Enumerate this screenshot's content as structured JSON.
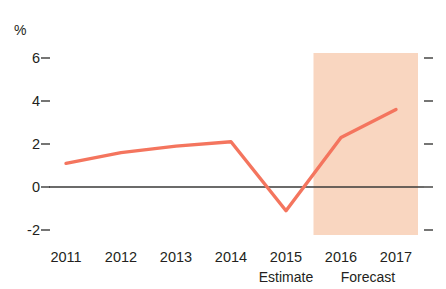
{
  "chart_data": {
    "type": "line",
    "title": "",
    "subtitle": "",
    "xlabel": "",
    "ylabel": "%",
    "unit_label": "%",
    "categories": [
      "2011",
      "2012",
      "2013",
      "2014",
      "2015",
      "2016",
      "2017"
    ],
    "x": [
      2011,
      2012,
      2013,
      2014,
      2015,
      2016,
      2017
    ],
    "values": [
      1.1,
      1.6,
      1.9,
      2.1,
      -1.1,
      2.3,
      3.6
    ],
    "series": [
      {
        "name": "GDP growth",
        "values": [
          1.1,
          1.6,
          1.9,
          2.1,
          -1.1,
          2.3,
          3.6
        ],
        "color": "#F4755E"
      }
    ],
    "ylim": [
      -2,
      6
    ],
    "ytick_labels": [
      "6",
      "4",
      "2",
      "0",
      "-2"
    ],
    "ytick_values": [
      6,
      4,
      2,
      0,
      -2
    ],
    "xtick_labels": [
      "2011",
      "2012",
      "2013",
      "2014",
      "2015",
      "2016",
      "2017"
    ],
    "grid": false,
    "legend": false,
    "legend_position": "none",
    "zero_line": true,
    "annotations": [
      {
        "name": "estimate",
        "label": "Estimate",
        "at_category": "2015"
      },
      {
        "name": "forecast",
        "label": "Forecast",
        "at_category": "2016"
      }
    ],
    "shaded_region": {
      "label": "Forecast",
      "from_x": 2015.5,
      "to_x": 2017.4,
      "color": "#F9D6C0"
    },
    "colors": {
      "line": "#F4755E",
      "shading": "#F9D6C0",
      "axis": "#3a3a38",
      "text": "#231f20"
    }
  },
  "axis": {
    "y_labels": [
      {
        "text": "6",
        "value": 6
      },
      {
        "text": "4",
        "value": 4
      },
      {
        "text": "2",
        "value": 2
      },
      {
        "text": "0",
        "value": 0
      },
      {
        "text": "-2",
        "value": -2
      }
    ],
    "x_labels": [
      {
        "text": "2011"
      },
      {
        "text": "2012"
      },
      {
        "text": "2013"
      },
      {
        "text": "2014"
      },
      {
        "text": "2015"
      },
      {
        "text": "2016"
      },
      {
        "text": "2017"
      }
    ],
    "phase_labels": [
      {
        "text": "Estimate"
      },
      {
        "text": "Forecast"
      }
    ]
  }
}
